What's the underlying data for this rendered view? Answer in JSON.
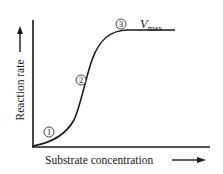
{
  "diagram": {
    "type": "enzyme-kinetics-sigmoid-curve",
    "x_axis_label": "Substrate concentration",
    "y_axis_label": "Reaction rate",
    "plateau_label_main": "V",
    "plateau_label_sub": "max",
    "markers": [
      {
        "id": 1,
        "symbol": "①",
        "position": "low-substrate initial rise"
      },
      {
        "id": 2,
        "symbol": "②",
        "position": "steep middle section"
      },
      {
        "id": 3,
        "symbol": "③",
        "position": "approaching plateau"
      }
    ],
    "colors": {
      "line": "#1a1a1a",
      "background": "#ffffff"
    }
  }
}
